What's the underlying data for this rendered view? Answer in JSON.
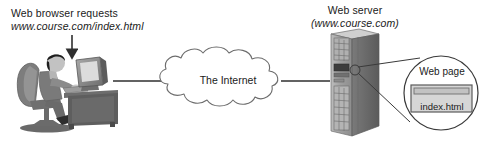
{
  "figure": {
    "width": 487,
    "height": 141
  },
  "client": {
    "label_line1": "Web browser requests",
    "label_line2": "www.course.com/index.html",
    "illustration": "person-at-desk-with-computer"
  },
  "network": {
    "cloud_label": "The Internet"
  },
  "server": {
    "label_line1": "Web server",
    "label_line2": "(www.course.com)",
    "illustration": "tower-server-computer"
  },
  "callout": {
    "title": "Web page",
    "file_name": "index.html"
  },
  "colors": {
    "outline": "#3a3a3a",
    "text": "#1a1a1a",
    "illustration_dark": "#5a5a5a",
    "illustration_mid": "#8a8a8a",
    "illustration_light": "#b8b8b8",
    "window_fill": "#d6d6d6",
    "background": "#ffffff"
  }
}
